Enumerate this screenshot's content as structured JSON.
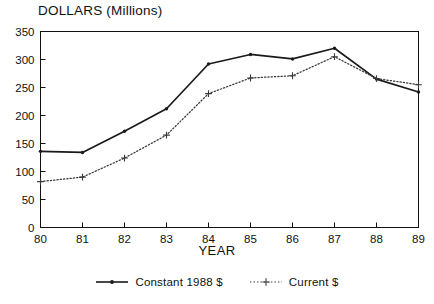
{
  "chart_data": {
    "type": "line",
    "title": "DOLLARS (Millions)",
    "xlabel": "YEAR",
    "ylabel": "",
    "x": [
      "80",
      "81",
      "82",
      "83",
      "84",
      "85",
      "86",
      "87",
      "88",
      "89"
    ],
    "categories": [
      "80",
      "81",
      "82",
      "83",
      "84",
      "85",
      "86",
      "87",
      "88",
      "89"
    ],
    "series": [
      {
        "name": "Constant 1988 $",
        "style": "solid",
        "marker": "dot",
        "color": "#1a1a1a",
        "values": [
          136,
          134,
          172,
          212,
          292,
          309,
          301,
          320,
          265,
          242
        ]
      },
      {
        "name": "Current $",
        "style": "dotted",
        "marker": "plus",
        "color": "#3a3a3a",
        "values": [
          82,
          90,
          124,
          165,
          239,
          267,
          271,
          305,
          266,
          255
        ]
      }
    ],
    "ylim": [
      0,
      350
    ],
    "yticks": [
      0,
      50,
      100,
      150,
      200,
      250,
      300,
      350
    ],
    "ytick_labels": [
      "0",
      "50",
      "100",
      "150",
      "200",
      "250",
      "300",
      "350"
    ],
    "xticks": [
      "80",
      "81",
      "82",
      "83",
      "84",
      "85",
      "86",
      "87",
      "88",
      "89"
    ],
    "grid": false,
    "legend_position": "bottom"
  },
  "legend": {
    "items": [
      {
        "label": "Constant 1988 $",
        "style": "solid",
        "marker": "dot"
      },
      {
        "label": "Current $",
        "style": "dotted",
        "marker": "plus"
      }
    ]
  },
  "colors": {
    "axis": "#111111",
    "series_1": "#1a1a1a",
    "series_2": "#3a3a3a",
    "background": "#ffffff"
  }
}
